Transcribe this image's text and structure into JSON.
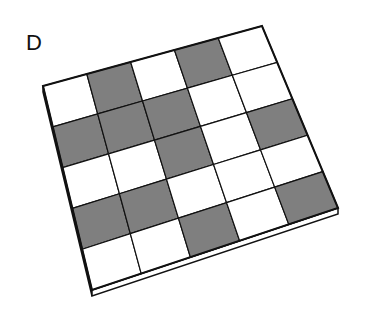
{
  "label": "D",
  "colors": {
    "gray": "#7f7f7f",
    "white": "#ffffff",
    "line": "#111111"
  },
  "grid": {
    "rows": 5,
    "cols": 5,
    "corners": {
      "tl": [
        43,
        86
      ],
      "tr": [
        262,
        26
      ],
      "br": [
        338,
        208
      ],
      "bl": [
        92,
        290
      ]
    },
    "cells": [
      [
        "W",
        "G",
        "W",
        "G",
        "W"
      ],
      [
        "G",
        "G",
        "G",
        "W",
        "W"
      ],
      [
        "W",
        "W",
        "G",
        "W",
        "G"
      ],
      [
        "G",
        "G",
        "W",
        "W",
        "W"
      ],
      [
        "W",
        "W",
        "G",
        "W",
        "G"
      ]
    ]
  }
}
